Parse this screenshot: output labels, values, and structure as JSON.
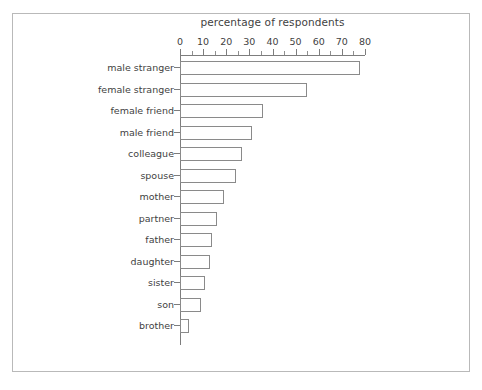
{
  "chart_data": {
    "type": "bar",
    "orientation": "horizontal",
    "title": "",
    "xlabel": "percentage of respondents",
    "ylabel": "",
    "xlim": [
      0,
      80
    ],
    "xticks": [
      0,
      10,
      20,
      30,
      40,
      50,
      60,
      70,
      80
    ],
    "xtick_labels": [
      "0",
      "10",
      "20",
      "30",
      "40",
      "50",
      "60",
      "70",
      "80"
    ],
    "minor_xticks": [
      5,
      15,
      25,
      35,
      45,
      55,
      65,
      75
    ],
    "grid": false,
    "legend": null,
    "axis_position": "top",
    "bar_fill": "#ffffff",
    "bar_edge": "#8a8a8a",
    "categories": [
      "male stranger",
      "female stranger",
      "female friend",
      "male friend",
      "colleague",
      "spouse",
      "mother",
      "partner",
      "father",
      "daughter",
      "sister",
      "son",
      "brother"
    ],
    "values": [
      78,
      55,
      36,
      31,
      27,
      24,
      19,
      16,
      14,
      13,
      11,
      9,
      4
    ]
  },
  "figure": {
    "border_color": "#b9b9b9",
    "background": "#ffffff"
  }
}
